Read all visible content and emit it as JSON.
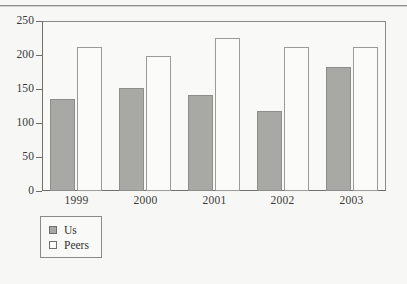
{
  "chart_data": {
    "type": "bar",
    "title": "",
    "subtitle": "",
    "xlabel": "",
    "ylabel": "",
    "categories": [
      "1999",
      "2000",
      "2001",
      "2002",
      "2003"
    ],
    "series": [
      {
        "name": "Us",
        "values": [
          135,
          152,
          141,
          118,
          183
        ],
        "color": "#a8a8a4"
      },
      {
        "name": "Peers",
        "values": [
          212,
          198,
          225,
          212,
          212
        ],
        "color": "#fbfbf9"
      }
    ],
    "ylim": [
      0,
      250
    ],
    "yticks": [
      0,
      50,
      100,
      150,
      200,
      250
    ],
    "ytick_labels": [
      "0",
      "50",
      "100",
      "150",
      "200",
      "250"
    ],
    "grid": false,
    "legend_position": "bottom-left",
    "annotations": []
  },
  "legend": {
    "entries": [
      {
        "label": "Us",
        "swatch": "filled-gray-square"
      },
      {
        "label": "Peers",
        "swatch": "empty-white-square"
      }
    ]
  },
  "axes": {
    "y_axis_name": "y-axis",
    "x_axis_name": "x-axis",
    "frame_color": "#8a8a86",
    "axis_color": "#6f6f6b"
  }
}
